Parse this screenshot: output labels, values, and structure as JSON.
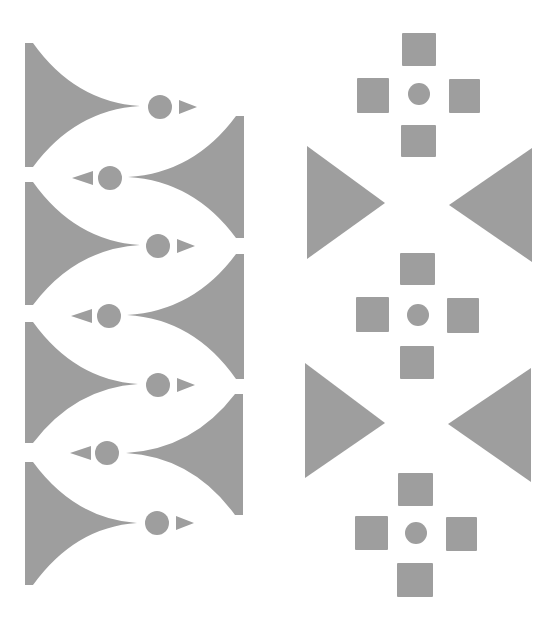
{
  "image": {
    "description": "Decorative geometric border pattern of gray shapes on white",
    "background": "#ffffff",
    "fill_color": "#9e9e9e",
    "width": 558,
    "height": 617
  },
  "left_column": {
    "horns_right_pointing": [
      {
        "left": 25,
        "top": 43,
        "bottom": 167,
        "tip": [
          140,
          106
        ],
        "circle": [
          160,
          107,
          12
        ],
        "arrow": [
          [
            179,
            100
          ],
          [
            197,
            107
          ],
          [
            179,
            114
          ]
        ]
      },
      {
        "left": 25,
        "top": 182,
        "bottom": 305,
        "tip": [
          140,
          245
        ],
        "circle": [
          158,
          246,
          12
        ],
        "arrow": [
          [
            177,
            239
          ],
          [
            195,
            246
          ],
          [
            177,
            253
          ]
        ]
      },
      {
        "left": 25,
        "top": 322,
        "bottom": 443,
        "tip": [
          138,
          384
        ],
        "circle": [
          158,
          385,
          12
        ],
        "arrow": [
          [
            177,
            378
          ],
          [
            195,
            385
          ],
          [
            177,
            392
          ]
        ]
      },
      {
        "left": 25,
        "top": 462,
        "bottom": 585,
        "tip": [
          137,
          523
        ],
        "circle": [
          157,
          523,
          12
        ],
        "arrow": [
          [
            176,
            516
          ],
          [
            194,
            523
          ],
          [
            176,
            530
          ]
        ]
      }
    ],
    "horns_left_pointing": [
      {
        "right": 244,
        "top": 116,
        "bottom": 238,
        "tip": [
          128,
          177
        ],
        "circle": [
          110,
          178,
          12
        ],
        "arrow": [
          [
            93,
            171
          ],
          [
            72,
            178
          ],
          [
            93,
            185
          ]
        ]
      },
      {
        "right": 244,
        "top": 254,
        "bottom": 379,
        "tip": [
          127,
          315
        ],
        "circle": [
          109,
          316,
          12
        ],
        "arrow": [
          [
            92,
            309
          ],
          [
            71,
            316
          ],
          [
            92,
            323
          ]
        ]
      },
      {
        "right": 243,
        "top": 394,
        "bottom": 515,
        "tip": [
          126,
          453
        ],
        "circle": [
          107,
          453,
          12
        ],
        "arrow": [
          [
            91,
            446
          ],
          [
            70,
            453
          ],
          [
            91,
            460
          ]
        ]
      }
    ]
  },
  "right_column": {
    "crosses": [
      {
        "center": [
          419,
          94
        ],
        "radius": 11,
        "squares": [
          [
            402,
            33,
            34,
            33
          ],
          [
            357,
            78,
            32,
            35
          ],
          [
            449,
            79,
            31,
            34
          ],
          [
            401,
            125,
            35,
            32
          ]
        ]
      },
      {
        "center": [
          418,
          315
        ],
        "radius": 11,
        "squares": [
          [
            400,
            253,
            35,
            32
          ],
          [
            356,
            297,
            33,
            35
          ],
          [
            447,
            298,
            32,
            35
          ],
          [
            400,
            346,
            34,
            33
          ]
        ]
      },
      {
        "center": [
          416,
          533
        ],
        "radius": 11,
        "squares": [
          [
            398,
            473,
            35,
            33
          ],
          [
            355,
            516,
            33,
            34
          ],
          [
            446,
            517,
            31,
            34
          ],
          [
            397,
            563,
            36,
            34
          ]
        ]
      }
    ],
    "triangle_pairs": [
      {
        "left": [
          [
            307,
            146
          ],
          [
            385,
            203
          ],
          [
            307,
            259
          ]
        ],
        "right": [
          [
            532,
            148
          ],
          [
            449,
            205
          ],
          [
            532,
            262
          ]
        ]
      },
      {
        "left": [
          [
            305,
            363
          ],
          [
            385,
            423
          ],
          [
            305,
            478
          ]
        ],
        "right": [
          [
            531,
            368
          ],
          [
            448,
            424
          ],
          [
            531,
            482
          ]
        ]
      }
    ]
  }
}
